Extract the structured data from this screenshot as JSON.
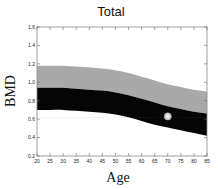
{
  "chart_data": {
    "type": "area",
    "title": "Total",
    "xlabel": "Age",
    "ylabel": "BMD",
    "xlim": [
      20,
      85
    ],
    "ylim": [
      0.2,
      1.6
    ],
    "x_ticks": [
      20,
      25,
      30,
      35,
      40,
      45,
      50,
      55,
      60,
      65,
      70,
      75,
      80,
      85
    ],
    "y_ticks": [
      0.2,
      0.4,
      0.6,
      0.8,
      1.0,
      1.2,
      1.4,
      1.6
    ],
    "y_tick_labels": [
      "0.2",
      "0.4",
      "0.6",
      "0.8",
      "1.0",
      "1.2",
      "1.4",
      "1.6"
    ],
    "grid": false,
    "x": [
      20,
      25,
      30,
      35,
      40,
      45,
      50,
      55,
      60,
      65,
      70,
      75,
      80,
      85
    ],
    "bands": [
      {
        "name": "upper-reference-band",
        "color": "#a9a9a9",
        "upper": [
          1.18,
          1.18,
          1.18,
          1.17,
          1.16,
          1.15,
          1.13,
          1.1,
          1.06,
          1.02,
          0.98,
          0.95,
          0.92,
          0.9
        ],
        "lower": [
          0.94,
          0.94,
          0.94,
          0.93,
          0.92,
          0.91,
          0.89,
          0.86,
          0.82,
          0.78,
          0.74,
          0.71,
          0.68,
          0.66
        ]
      },
      {
        "name": "lower-reference-band",
        "color": "#050505",
        "upper": [
          0.94,
          0.94,
          0.94,
          0.93,
          0.92,
          0.91,
          0.89,
          0.86,
          0.82,
          0.78,
          0.74,
          0.71,
          0.68,
          0.66
        ],
        "lower": [
          0.7,
          0.7,
          0.7,
          0.69,
          0.68,
          0.67,
          0.65,
          0.62,
          0.58,
          0.54,
          0.51,
          0.48,
          0.45,
          0.42
        ]
      }
    ],
    "reference_line": {
      "y": 0.62,
      "style": "dotted",
      "color": "#777777"
    },
    "points": [
      {
        "x": 70,
        "y": 0.63,
        "label": "patient-measurement"
      }
    ]
  }
}
